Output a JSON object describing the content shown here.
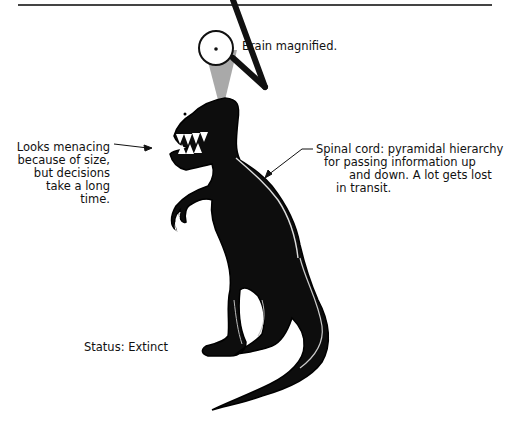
{
  "figure": {
    "top_rule": true,
    "labels": {
      "brain": "Brain magnified.",
      "menacing": [
        "Looks menacing",
        "because of size,",
        "but decisions",
        "take a long",
        "time."
      ],
      "spinal": [
        "Spinal cord: pyramidal hierarchy",
        "for passing information up",
        "and down. A lot gets lost",
        "in transit."
      ],
      "status": "Status: Extinct"
    },
    "icons": {
      "magnifier": "magnifying-glass-icon",
      "dinosaur": "tyrannosaurus-illustration"
    },
    "colors": {
      "ink": "#111111",
      "background": "#ffffff",
      "beam": "#9a9a9a"
    }
  }
}
